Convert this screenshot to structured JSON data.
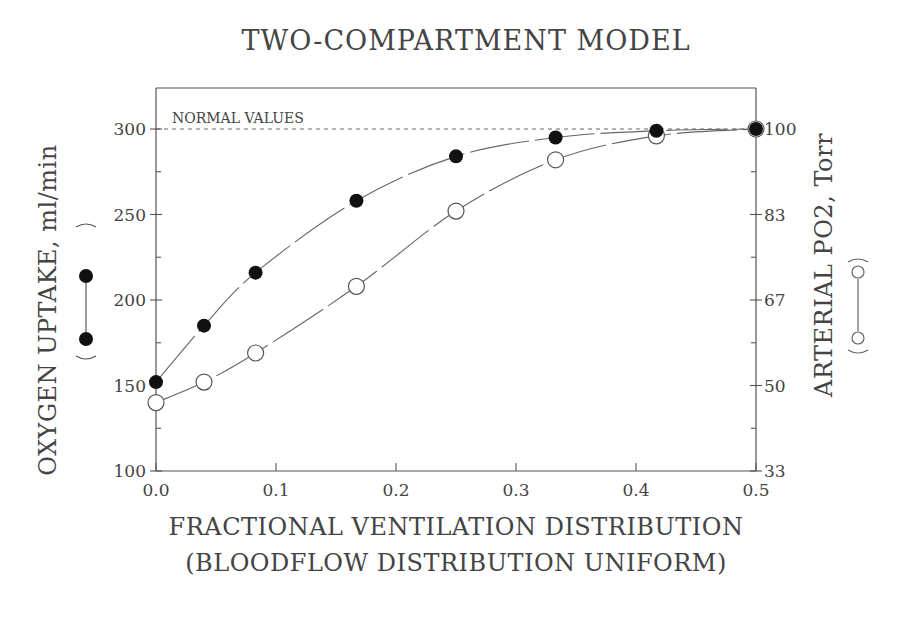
{
  "chart_data": {
    "type": "line",
    "title": "TWO-COMPARTMENT MODEL",
    "xlabel": "FRACTIONAL VENTILATION DISTRIBUTION",
    "xlabel_line2": "(BLOODFLOW DISTRIBUTION UNIFORM)",
    "ylabel_left": "OXYGEN UPTAKE, ml/min",
    "ylabel_left_legend": "(●—●)",
    "ylabel_right": "ARTERIAL PO2, Torr",
    "ylabel_right_legend": "(○—○)",
    "xlim": [
      0.0,
      0.5
    ],
    "ylim_left": [
      100,
      300
    ],
    "ylim_right": [
      33,
      100
    ],
    "x_ticks": [
      "0.0",
      "0.1",
      "0.2",
      "0.3",
      "0.4",
      "0.5"
    ],
    "y_left_ticks": [
      "100",
      "150",
      "200",
      "250",
      "300"
    ],
    "y_right_ticks": [
      "33",
      "50",
      "67",
      "83",
      "100"
    ],
    "annotation": "NORMAL VALUES",
    "reference_line_y": 300,
    "grid": false,
    "series": [
      {
        "name": "Oxygen uptake (ml/min)",
        "marker": "filled-circle",
        "axis": "left",
        "x": [
          0.0,
          0.04,
          0.083,
          0.167,
          0.25,
          0.333,
          0.417,
          0.5
        ],
        "values": [
          152,
          185,
          216,
          258,
          284,
          295,
          299,
          300
        ]
      },
      {
        "name": "Arterial PO2 (Torr, plotted on left scale)",
        "marker": "open-circle",
        "axis": "right",
        "x": [
          0.0,
          0.04,
          0.083,
          0.167,
          0.25,
          0.333,
          0.417,
          0.5
        ],
        "values": [
          140,
          152,
          169,
          208,
          252,
          282,
          296,
          300
        ],
        "values_torr": [
          47,
          51,
          56,
          69,
          84,
          94,
          99,
          100
        ]
      }
    ]
  }
}
